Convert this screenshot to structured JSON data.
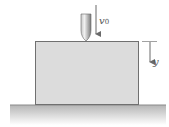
{
  "figure": {
    "labels": {
      "velocity": "v",
      "velocity_sub": "0",
      "depth": "y"
    },
    "colors": {
      "block_fill": "#dcdcdc",
      "block_edge": "#6e6e6e",
      "ground_top": "#b8b8b8",
      "ground_bottom": "#ffffff",
      "bullet": "#9a9a9a",
      "arrow": "#6a6a6a"
    }
  }
}
